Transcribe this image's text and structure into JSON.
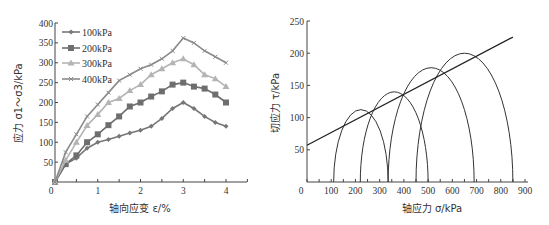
{
  "chart_data": [
    {
      "type": "line",
      "title": "",
      "xlabel": "轴向应变 ε/%",
      "ylabel": "应力 σ1～σ3/kPa",
      "xlim": [
        0,
        4.5
      ],
      "ylim": [
        0,
        400
      ],
      "xticks": [
        0,
        1,
        2,
        3,
        4
      ],
      "yticks": [
        50,
        100,
        150,
        200,
        250,
        300,
        350,
        400
      ],
      "grid": false,
      "legend_position": "upper-left",
      "x": [
        0,
        0.25,
        0.5,
        0.75,
        1.0,
        1.25,
        1.5,
        1.75,
        2.0,
        2.25,
        2.5,
        2.75,
        3.0,
        3.25,
        3.5,
        3.75,
        4.0
      ],
      "series": [
        {
          "name": "100kPa",
          "color": "#777777",
          "marker": "diamond",
          "values": [
            0,
            45,
            60,
            85,
            100,
            107,
            115,
            123,
            130,
            140,
            160,
            185,
            200,
            185,
            165,
            150,
            140
          ]
        },
        {
          "name": "200kPa",
          "color": "#6e6e6e",
          "marker": "square",
          "values": [
            0,
            45,
            67,
            100,
            120,
            143,
            165,
            190,
            200,
            215,
            228,
            245,
            250,
            240,
            235,
            220,
            200
          ]
        },
        {
          "name": "300kPa",
          "color": "#b4b4b4",
          "marker": "triangle",
          "values": [
            0,
            55,
            100,
            142,
            170,
            200,
            210,
            230,
            245,
            270,
            285,
            300,
            310,
            295,
            270,
            260,
            240
          ]
        },
        {
          "name": "400kPa",
          "color": "#8a8a8a",
          "marker": "cross",
          "values": [
            0,
            75,
            120,
            165,
            195,
            225,
            255,
            270,
            285,
            295,
            310,
            330,
            362,
            350,
            330,
            315,
            300
          ]
        }
      ]
    },
    {
      "type": "mohr-circle",
      "title": "",
      "xlabel": "轴应力 σ/kPa",
      "ylabel": "切应力 τ/kPa",
      "xlim": [
        0,
        900
      ],
      "ylim": [
        0,
        250
      ],
      "xticks": [
        0,
        100,
        200,
        300,
        400,
        500,
        600,
        700,
        800,
        900
      ],
      "yticks": [
        50,
        100,
        150,
        200,
        250
      ],
      "grid": false,
      "circles": [
        {
          "sigma3": 110,
          "sigma1": 335
        },
        {
          "sigma3": 220,
          "sigma1": 500
        },
        {
          "sigma3": 335,
          "sigma1": 690
        },
        {
          "sigma3": 450,
          "sigma1": 850
        }
      ],
      "envelope": {
        "x": [
          0,
          850
        ],
        "y": [
          57,
          225
        ]
      }
    }
  ]
}
